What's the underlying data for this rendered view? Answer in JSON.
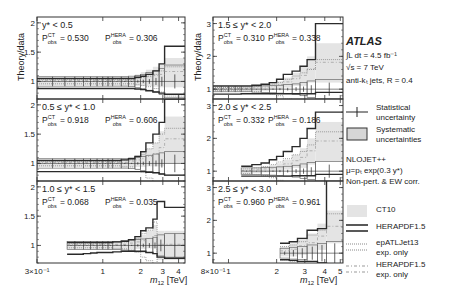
{
  "chart_data": {
    "type": "line",
    "ylabel": "Theory/data",
    "xlabel": "m12 [TeV]",
    "xscale": "log",
    "panels": [
      {
        "label": "y* < 0.5",
        "p_ct": "0.530",
        "p_hera": "0.306",
        "column": 0,
        "row": 0,
        "xlim": [
          0.3,
          4.5
        ],
        "ylim": [
          0.7,
          2.1
        ],
        "yticks": [
          1,
          1.5,
          2
        ],
        "bins": [
          0.3,
          0.4,
          0.5,
          0.6,
          0.7,
          0.8,
          0.9,
          1.0,
          1.1,
          1.2,
          1.4,
          1.6,
          1.8,
          2.0,
          2.2,
          2.5,
          2.8,
          3.1,
          4.5
        ],
        "ct10": [
          1.0,
          1.0,
          1.0,
          1.0,
          1.0,
          1.0,
          1.0,
          1.0,
          1.0,
          1.0,
          1.0,
          1.0,
          1.02,
          1.04,
          1.06,
          1.08,
          1.1,
          1.15
        ],
        "ct10_err": [
          0.06,
          0.06,
          0.06,
          0.06,
          0.06,
          0.06,
          0.06,
          0.07,
          0.07,
          0.07,
          0.08,
          0.08,
          0.1,
          0.12,
          0.14,
          0.17,
          0.2,
          0.25
        ],
        "herapdf": [
          1.05,
          1.05,
          1.05,
          1.05,
          1.05,
          1.05,
          1.05,
          1.05,
          1.05,
          1.05,
          1.05,
          1.05,
          1.07,
          1.09,
          1.12,
          1.18,
          1.3,
          1.6
        ],
        "herapdf_lo": [
          0.88,
          0.88,
          0.88,
          0.88,
          0.88,
          0.88,
          0.88,
          0.88,
          0.88,
          0.88,
          0.88,
          0.88,
          0.87,
          0.86,
          0.84,
          0.82,
          0.8,
          0.78
        ],
        "epatljet": [
          1.04,
          1.04,
          1.04,
          1.04,
          1.04,
          1.04,
          1.04,
          1.04,
          1.04,
          1.04,
          1.04,
          1.04,
          1.05,
          1.07,
          1.09,
          1.12,
          1.18,
          1.25
        ],
        "syst": [
          0.08,
          0.08,
          0.08,
          0.08,
          0.08,
          0.08,
          0.08,
          0.08,
          0.08,
          0.08,
          0.08,
          0.09,
          0.1,
          0.12,
          0.15,
          0.18,
          0.22,
          0.28
        ],
        "stat": [
          0.005,
          0.005,
          0.005,
          0.005,
          0.005,
          0.005,
          0.005,
          0.005,
          0.005,
          0.005,
          0.01,
          0.01,
          0.02,
          0.03,
          0.04,
          0.06,
          0.08,
          0.12
        ]
      },
      {
        "label": "0.5 ≤ y* < 1.0",
        "p_ct": "0.918",
        "p_hera": "0.606",
        "column": 0,
        "row": 1,
        "xlim": [
          0.3,
          4.5
        ],
        "ylim": [
          0.7,
          2.1
        ],
        "yticks": [
          1,
          1.5,
          2
        ],
        "bins": [
          0.3,
          0.4,
          0.5,
          0.6,
          0.7,
          0.8,
          0.9,
          1.0,
          1.1,
          1.2,
          1.4,
          1.6,
          1.8,
          2.0,
          2.2,
          2.5,
          2.8,
          3.1,
          4.5
        ],
        "ct10": [
          1.0,
          1.0,
          1.0,
          1.0,
          1.0,
          1.0,
          1.0,
          1.0,
          1.0,
          1.0,
          1.0,
          1.02,
          1.04,
          1.06,
          1.1,
          1.15,
          1.25,
          1.4
        ],
        "ct10_err": [
          0.06,
          0.06,
          0.06,
          0.06,
          0.06,
          0.06,
          0.06,
          0.06,
          0.07,
          0.07,
          0.08,
          0.09,
          0.1,
          0.12,
          0.15,
          0.2,
          0.3,
          0.4
        ],
        "herapdf": [
          1.05,
          1.05,
          1.05,
          1.05,
          1.05,
          1.05,
          1.05,
          1.05,
          1.05,
          1.05,
          1.06,
          1.08,
          1.12,
          1.2,
          1.35,
          1.5,
          1.7,
          2.1
        ],
        "herapdf_lo": [
          0.86,
          0.86,
          0.86,
          0.86,
          0.86,
          0.86,
          0.86,
          0.86,
          0.86,
          0.86,
          0.86,
          0.86,
          0.86,
          0.86,
          0.85,
          0.84,
          0.82,
          0.8
        ],
        "epatljet": [
          1.04,
          1.04,
          1.04,
          1.04,
          1.04,
          1.04,
          1.04,
          1.04,
          1.04,
          1.04,
          1.05,
          1.06,
          1.1,
          1.15,
          1.25,
          1.35,
          1.5,
          1.6
        ],
        "syst": [
          0.08,
          0.08,
          0.08,
          0.08,
          0.08,
          0.08,
          0.08,
          0.08,
          0.08,
          0.08,
          0.08,
          0.09,
          0.1,
          0.12,
          0.14,
          0.16,
          0.18,
          0.2
        ],
        "stat": [
          0.005,
          0.005,
          0.005,
          0.005,
          0.005,
          0.005,
          0.005,
          0.005,
          0.005,
          0.005,
          0.01,
          0.01,
          0.02,
          0.03,
          0.04,
          0.05,
          0.07,
          0.15
        ]
      },
      {
        "label": "1.0 ≤ y* < 1.5",
        "p_ct": "0.068",
        "p_hera": "0.035",
        "column": 0,
        "row": 2,
        "xlim": [
          0.3,
          4.5
        ],
        "ylim": [
          0.7,
          2.1
        ],
        "yticks": [
          1,
          1.5,
          2
        ],
        "bins": [
          0.52,
          0.6,
          0.7,
          0.8,
          0.9,
          1.0,
          1.1,
          1.2,
          1.4,
          1.6,
          1.8,
          2.0,
          2.2,
          2.5,
          2.7,
          3.1,
          4.5
        ],
        "ct10": [
          1.0,
          1.0,
          1.0,
          1.0,
          1.0,
          1.0,
          1.0,
          1.0,
          1.0,
          1.02,
          1.04,
          1.06,
          1.1,
          1.15,
          1.0,
          1.0
        ],
        "ct10_err": [
          0.06,
          0.06,
          0.06,
          0.06,
          0.06,
          0.07,
          0.07,
          0.07,
          0.08,
          0.09,
          0.1,
          0.12,
          0.15,
          0.2,
          0.25,
          0.25
        ],
        "herapdf": [
          1.05,
          1.05,
          1.05,
          1.05,
          1.05,
          1.05,
          1.05,
          1.06,
          1.07,
          1.1,
          1.15,
          1.25,
          1.3,
          1.45,
          1.75,
          1.65
        ],
        "herapdf_lo": [
          0.85,
          0.85,
          0.86,
          0.87,
          0.88,
          0.88,
          0.88,
          0.89,
          0.9,
          0.9,
          0.9,
          0.9,
          0.88,
          0.86,
          0.8,
          0.78
        ],
        "epatljet": [
          1.04,
          1.04,
          1.04,
          1.04,
          1.04,
          1.04,
          1.04,
          1.05,
          1.06,
          1.08,
          1.12,
          1.2,
          1.26,
          1.4,
          1.0,
          1.0
        ],
        "syst": [
          0.07,
          0.07,
          0.07,
          0.07,
          0.07,
          0.07,
          0.07,
          0.07,
          0.08,
          0.09,
          0.1,
          0.11,
          0.12,
          0.14,
          0.18,
          0.2
        ],
        "stat": [
          0.005,
          0.005,
          0.005,
          0.005,
          0.005,
          0.005,
          0.005,
          0.005,
          0.01,
          0.01,
          0.02,
          0.03,
          0.04,
          0.05,
          0.1,
          0.2
        ]
      },
      {
        "label": "1.5 ≤ y* < 2.0",
        "p_ct": "0.310",
        "p_hera": "0.338",
        "column": 1,
        "row": 0,
        "xlim": [
          0.8,
          5.2
        ],
        "ylim": [
          0.7,
          3.2
        ],
        "yticks": [
          1,
          2,
          3
        ],
        "bins": [
          0.8,
          0.9,
          1.0,
          1.1,
          1.2,
          1.4,
          1.6,
          1.8,
          2.0,
          2.2,
          2.5,
          2.8,
          3.1,
          3.5,
          5.2
        ],
        "ct10": [
          1.0,
          1.0,
          1.0,
          1.0,
          1.0,
          1.02,
          1.04,
          1.08,
          1.12,
          1.2,
          1.3,
          1.4,
          1.6,
          1.8
        ],
        "ct10_err": [
          0.06,
          0.06,
          0.06,
          0.07,
          0.07,
          0.08,
          0.09,
          0.1,
          0.12,
          0.15,
          0.2,
          0.3,
          0.4,
          0.6
        ],
        "herapdf": [
          1.1,
          1.1,
          1.1,
          1.1,
          1.1,
          1.12,
          1.15,
          1.2,
          1.3,
          1.45,
          1.55,
          1.7,
          1.9,
          3.0
        ],
        "herapdf_lo": [
          0.85,
          0.85,
          0.85,
          0.85,
          0.86,
          0.86,
          0.86,
          0.86,
          0.86,
          0.86,
          0.86,
          0.86,
          0.86,
          0.9
        ],
        "epatljet": [
          1.05,
          1.05,
          1.05,
          1.05,
          1.06,
          1.08,
          1.1,
          1.15,
          1.2,
          1.3,
          1.4,
          1.5,
          1.6,
          1.9
        ],
        "syst": [
          0.08,
          0.08,
          0.08,
          0.08,
          0.08,
          0.09,
          0.1,
          0.11,
          0.12,
          0.14,
          0.16,
          0.2,
          0.25,
          0.3
        ],
        "stat": [
          0.005,
          0.005,
          0.005,
          0.005,
          0.005,
          0.01,
          0.01,
          0.02,
          0.03,
          0.04,
          0.06,
          0.08,
          0.12,
          0.2
        ]
      },
      {
        "label": "2.0 ≤ y* < 2.5",
        "p_ct": "0.332",
        "p_hera": "0.186",
        "column": 1,
        "row": 1,
        "xlim": [
          0.8,
          5.2
        ],
        "ylim": [
          0.7,
          3.2
        ],
        "yticks": [
          1,
          2,
          3
        ],
        "bins": [
          1.2,
          1.4,
          1.6,
          1.8,
          2.0,
          2.2,
          2.5,
          2.8,
          3.1,
          3.5,
          5.2
        ],
        "ct10": [
          1.0,
          1.02,
          1.05,
          1.08,
          1.12,
          1.2,
          1.3,
          1.4,
          1.6,
          1.9
        ],
        "ct10_err": [
          0.07,
          0.08,
          0.09,
          0.1,
          0.12,
          0.15,
          0.2,
          0.3,
          0.4,
          0.6
        ],
        "herapdf": [
          1.15,
          1.2,
          1.25,
          1.35,
          1.45,
          1.6,
          1.75,
          2.0,
          2.3,
          2.8
        ],
        "herapdf_lo": [
          0.85,
          0.85,
          0.85,
          0.85,
          0.85,
          0.85,
          0.86,
          0.86,
          0.86,
          0.9
        ],
        "epatljet": [
          1.07,
          1.1,
          1.14,
          1.2,
          1.28,
          1.38,
          1.5,
          1.6,
          1.8,
          2.2
        ],
        "syst": [
          0.1,
          0.1,
          0.11,
          0.12,
          0.13,
          0.15,
          0.18,
          0.22,
          0.26,
          0.3
        ],
        "stat": [
          0.01,
          0.01,
          0.01,
          0.02,
          0.03,
          0.04,
          0.06,
          0.08,
          0.12,
          0.2
        ]
      },
      {
        "label": "2.5 ≤ y* < 3.0",
        "p_ct": "0.960",
        "p_hera": "0.961",
        "column": 1,
        "row": 2,
        "xlim": [
          0.8,
          5.2
        ],
        "ylim": [
          0.7,
          3.2
        ],
        "yticks": [
          1,
          2,
          3
        ],
        "bins": [
          2.1,
          2.4,
          2.7,
          3.1,
          3.6,
          4.1,
          5.2
        ],
        "ct10": [
          1.05,
          1.1,
          1.2,
          1.3,
          1.5,
          1.8
        ],
        "ct10_err": [
          0.15,
          0.2,
          0.25,
          0.3,
          0.4,
          0.5
        ],
        "herapdf": [
          1.3,
          1.35,
          1.45,
          1.7,
          1.75,
          3.3
        ],
        "herapdf_lo": [
          0.8,
          0.78,
          0.75,
          0.75,
          0.7,
          0.6
        ],
        "epatljet": [
          1.2,
          1.25,
          1.35,
          1.55,
          1.7,
          2.2
        ],
        "syst": [
          0.15,
          0.18,
          0.2,
          0.25,
          0.3,
          0.35
        ],
        "stat": [
          0.05,
          0.1,
          0.15,
          0.2,
          0.25,
          0.3
        ]
      }
    ],
    "xticks_left": [
      {
        "v": 0.3,
        "label": "3×10⁻¹"
      },
      {
        "v": 1,
        "label": "1"
      },
      {
        "v": 2,
        "label": "2"
      },
      {
        "v": 3,
        "label": "3"
      },
      {
        "v": 4,
        "label": "4"
      }
    ],
    "xticks_right": [
      {
        "v": 0.8,
        "label": "8×10⁻¹"
      },
      {
        "v": 1,
        "label": "1"
      },
      {
        "v": 2,
        "label": "2"
      },
      {
        "v": 3,
        "label": "3"
      },
      {
        "v": 4,
        "label": "4"
      },
      {
        "v": 5,
        "label": "5"
      }
    ],
    "legend": [
      {
        "name": "Statistical uncertainty",
        "style": "errorbar"
      },
      {
        "name": "Systematic uncertainties",
        "style": "box"
      },
      {
        "name": "CT10",
        "style": "fill"
      },
      {
        "name": "HERAPDF1.5",
        "style": "thickline"
      },
      {
        "name": "epATLJet13 exp. only",
        "style": "dotted"
      },
      {
        "name": "HERAPDF1.5 exp. only",
        "style": "dashdot"
      }
    ]
  },
  "labels": {
    "ylabel": "Theory/data",
    "xlabel_main": "m",
    "xlabel_sub": "12",
    "xlabel_unit": " [TeV]",
    "p_sup_ct": "CT",
    "p_sup_hera": "HERA",
    "p_sub": "obs",
    "p_letter": "P"
  },
  "legend": {
    "atlas": "ATLAS",
    "lumi": "∫L dt = 4.5 fb⁻¹",
    "sqrt_s": "√s = 7 TeV",
    "jets": "anti-kₜ jets, R = 0.4",
    "stat_1": "Statistical",
    "stat_2": "uncertainty",
    "syst_1": "Systematic",
    "syst_2": "uncertainties",
    "nlo_1": "NLOJET++",
    "nlo_2": "μ=pₜ exp(0.3 y*)",
    "nlo_3": "Non-pert. & EW corr.",
    "ct10": "CT10",
    "hera": "HERAPDF1.5",
    "epatl_1": "epATLJet13",
    "epatl_2": "exp. only",
    "heraexp_1": "HERAPDF1.5",
    "heraexp_2": "exp. only"
  },
  "colors": {
    "frame": "#333333",
    "ct10_fill": "#e4e4e4",
    "syst_fill": "#d6d6d6",
    "hera_line": "#2a2a2a",
    "epatl_line": "#888888",
    "text": "#222222"
  }
}
